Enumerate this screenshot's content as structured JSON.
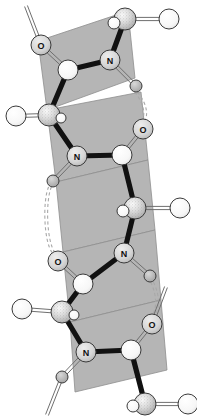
{
  "figure": {
    "background_color": "#ffffff"
  },
  "style": {
    "plane_fill": "#b5b5b5",
    "plane_stroke": "#8e8e8e",
    "bond_color": "#111111",
    "light_bond_color": "#6f6f6f",
    "atom_outline": "#3a3a3a",
    "atom_fill_light": "#f2f2f2",
    "atom_fill_mid": "#cfcfcf",
    "atom_fill_dark": "#9a9a9a",
    "hbond_color": "#a8a8a8",
    "label_color": "#111111"
  },
  "legend": {
    "atom_names": [
      "N",
      "O",
      "C",
      "H",
      "CA"
    ],
    "nitrogen_label": "N",
    "oxygen_label": "O"
  },
  "peptide_planes": [
    {
      "id": "plane-1",
      "points": "38,41 128,11 135,78 47,110"
    },
    {
      "id": "plane-2",
      "points": "47,110 141,92 148,160 56,182"
    },
    {
      "id": "plane-3",
      "points": "56,182 148,160 155,230 63,252"
    },
    {
      "id": "plane-4",
      "points": "63,252 155,230 161,300 70,322"
    },
    {
      "id": "plane-5",
      "points": "70,322 161,300 167,370 75,392"
    }
  ],
  "atoms": [
    {
      "id": "a1",
      "element": "O",
      "label": "O",
      "x": 41,
      "y": 45,
      "r": 10,
      "kind": "labeled"
    },
    {
      "id": "a2",
      "element": "C",
      "label": "",
      "x": 68,
      "y": 70,
      "r": 10,
      "kind": "plain"
    },
    {
      "id": "a3",
      "element": "CA",
      "label": "",
      "x": 125,
      "y": 19,
      "r": 11,
      "kind": "stipple"
    },
    {
      "id": "a4",
      "element": "H",
      "label": "",
      "x": 169,
      "y": 19,
      "r": 10,
      "kind": "open"
    },
    {
      "id": "a5",
      "element": "H",
      "label": "",
      "x": 114,
      "y": 23,
      "r": 6,
      "kind": "open"
    },
    {
      "id": "a6",
      "element": "N",
      "label": "N",
      "x": 110,
      "y": 60,
      "r": 10,
      "kind": "labeled"
    },
    {
      "id": "a7",
      "element": "H",
      "label": "",
      "x": 136,
      "y": 86,
      "r": 6,
      "kind": "small"
    },
    {
      "id": "a8",
      "element": "CA",
      "label": "",
      "x": 49,
      "y": 115,
      "r": 11,
      "kind": "stipple"
    },
    {
      "id": "a9",
      "element": "H",
      "label": "",
      "x": 16,
      "y": 116,
      "r": 10,
      "kind": "open"
    },
    {
      "id": "a10",
      "element": "H",
      "label": "",
      "x": 61,
      "y": 118,
      "r": 5,
      "kind": "open"
    },
    {
      "id": "a11",
      "element": "O",
      "label": "O",
      "x": 143,
      "y": 129,
      "r": 10,
      "kind": "labeled"
    },
    {
      "id": "a12",
      "element": "C",
      "label": "",
      "x": 122,
      "y": 155,
      "r": 10,
      "kind": "plain"
    },
    {
      "id": "a13",
      "element": "N",
      "label": "N",
      "x": 77,
      "y": 156,
      "r": 10,
      "kind": "labeled"
    },
    {
      "id": "a14",
      "element": "H",
      "label": "",
      "x": 53,
      "y": 181,
      "r": 6,
      "kind": "small"
    },
    {
      "id": "a15",
      "element": "CA",
      "label": "",
      "x": 135,
      "y": 208,
      "r": 11,
      "kind": "stipple"
    },
    {
      "id": "a16",
      "element": "H",
      "label": "",
      "x": 180,
      "y": 208,
      "r": 10,
      "kind": "open"
    },
    {
      "id": "a17",
      "element": "H",
      "label": "",
      "x": 123,
      "y": 211,
      "r": 6,
      "kind": "open"
    },
    {
      "id": "a18",
      "element": "O",
      "label": "O",
      "x": 58,
      "y": 261,
      "r": 10,
      "kind": "labeled"
    },
    {
      "id": "a19",
      "element": "C",
      "label": "",
      "x": 83,
      "y": 284,
      "r": 10,
      "kind": "plain"
    },
    {
      "id": "a20",
      "element": "N",
      "label": "N",
      "x": 124,
      "y": 253,
      "r": 10,
      "kind": "labeled"
    },
    {
      "id": "a21",
      "element": "H",
      "label": "",
      "x": 150,
      "y": 276,
      "r": 6,
      "kind": "small"
    },
    {
      "id": "a22",
      "element": "CA",
      "label": "",
      "x": 62,
      "y": 312,
      "r": 11,
      "kind": "stipple"
    },
    {
      "id": "a23",
      "element": "H",
      "label": "",
      "x": 22,
      "y": 309,
      "r": 10,
      "kind": "open"
    },
    {
      "id": "a24",
      "element": "H",
      "label": "",
      "x": 74,
      "y": 315,
      "r": 5,
      "kind": "open"
    },
    {
      "id": "a25",
      "element": "O",
      "label": "O",
      "x": 152,
      "y": 324,
      "r": 10,
      "kind": "labeled"
    },
    {
      "id": "a26",
      "element": "C",
      "label": "",
      "x": 131,
      "y": 350,
      "r": 10,
      "kind": "plain"
    },
    {
      "id": "a27",
      "element": "N",
      "label": "N",
      "x": 86,
      "y": 352,
      "r": 10,
      "kind": "labeled"
    },
    {
      "id": "a28",
      "element": "H",
      "label": "",
      "x": 62,
      "y": 377,
      "r": 6,
      "kind": "small"
    },
    {
      "id": "a29",
      "element": "CA",
      "label": "",
      "x": 145,
      "y": 404,
      "r": 11,
      "kind": "stipple"
    },
    {
      "id": "a30",
      "element": "H",
      "label": "",
      "x": 188,
      "y": 404,
      "r": 10,
      "kind": "open"
    },
    {
      "id": "a31",
      "element": "H",
      "label": "",
      "x": 133,
      "y": 406,
      "r": 6,
      "kind": "open"
    }
  ],
  "bonds_thick": [
    {
      "from": "a2",
      "to": "a8"
    },
    {
      "from": "a2",
      "to": "a6"
    },
    {
      "from": "a6",
      "to": "a3"
    },
    {
      "from": "a8",
      "to": "a13"
    },
    {
      "from": "a13",
      "to": "a12"
    },
    {
      "from": "a12",
      "to": "a15"
    },
    {
      "from": "a15",
      "to": "a20"
    },
    {
      "from": "a20",
      "to": "a19"
    },
    {
      "from": "a19",
      "to": "a22"
    },
    {
      "from": "a22",
      "to": "a27"
    },
    {
      "from": "a27",
      "to": "a26"
    },
    {
      "from": "a26",
      "to": "a29"
    }
  ],
  "bonds_double": [
    {
      "from": "a2",
      "to": "a1"
    },
    {
      "from": "a12",
      "to": "a11"
    },
    {
      "from": "a19",
      "to": "a18"
    },
    {
      "from": "a26",
      "to": "a25"
    },
    {
      "from": "a6",
      "to": "a7"
    },
    {
      "from": "a13",
      "to": "a14"
    },
    {
      "from": "a20",
      "to": "a21"
    },
    {
      "from": "a27",
      "to": "a28"
    },
    {
      "from": "a3",
      "to": "a4"
    },
    {
      "from": "a8",
      "to": "a9"
    },
    {
      "from": "a15",
      "to": "a16"
    },
    {
      "from": "a22",
      "to": "a23"
    },
    {
      "from": "a29",
      "to": "a30"
    }
  ],
  "bonds_offscreen": [
    {
      "id": "off-top-left",
      "x1": 41,
      "y1": 45,
      "x2": 26,
      "y2": 6
    },
    {
      "id": "off-bottom-left",
      "x1": 62,
      "y1": 377,
      "x2": 47,
      "y2": 415
    },
    {
      "id": "off-bottom-right",
      "x1": 152,
      "y1": 324,
      "x2": 166,
      "y2": 287
    }
  ],
  "hydrogen_bonds": [
    {
      "id": "hb-1",
      "from": "a7",
      "to": "a11",
      "path": "M136,92 C146,104 147,116 143,121"
    },
    {
      "id": "hb-2",
      "from": "a14",
      "to": "a18",
      "path": "M50,187 C44,200 45,243 54,253"
    },
    {
      "id": "hb-3",
      "from": "a21",
      "to": "a25",
      "path": "M152,282 C159,296 158,310 153,316"
    }
  ]
}
